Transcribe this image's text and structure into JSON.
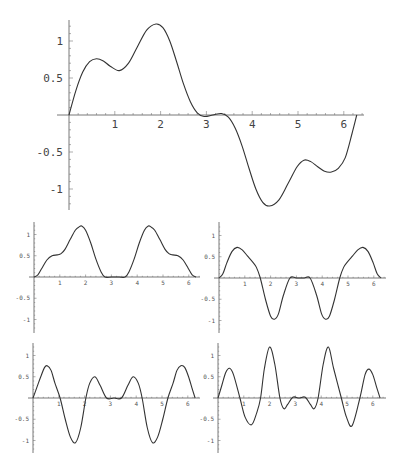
{
  "chart_data": [
    {
      "type": "line",
      "name": "main-plot",
      "title": "",
      "xlabel": "",
      "ylabel": "",
      "xlim": [
        0,
        6.283
      ],
      "ylim": [
        -1.3,
        1.3
      ],
      "grid": false,
      "x_ticks": [
        1,
        2,
        3,
        4,
        5,
        6
      ],
      "x_tick_labels": [
        "1",
        "2",
        "3",
        "4",
        "5",
        "6"
      ],
      "y_ticks": [
        -1,
        -0.5,
        0.5,
        1
      ],
      "y_tick_labels": [
        "-1",
        "-0.5",
        "0.5",
        "1"
      ],
      "frame": {
        "ox": 69,
        "oy": 115,
        "sx": 45.8,
        "sy": 74,
        "ytop": 20,
        "ybot": 210,
        "xend": 364,
        "label_size": "big"
      },
      "x": [
        0,
        0.15,
        0.3,
        0.45,
        0.6,
        0.75,
        0.9,
        1.1,
        1.3,
        1.5,
        1.7,
        1.9,
        2.05,
        2.2,
        2.35,
        2.5,
        2.65,
        2.8,
        2.95,
        3.14,
        3.33,
        3.48,
        3.63,
        3.78,
        3.93,
        4.08,
        4.23,
        4.38,
        4.58,
        4.78,
        4.98,
        5.13,
        5.28,
        5.43,
        5.58,
        5.73,
        5.88,
        6.03,
        6.18,
        6.283
      ],
      "values": [
        0,
        0.33,
        0.58,
        0.72,
        0.76,
        0.73,
        0.66,
        0.6,
        0.7,
        0.93,
        1.15,
        1.23,
        1.18,
        1.0,
        0.72,
        0.42,
        0.18,
        0.03,
        -0.02,
        0,
        0.02,
        -0.03,
        -0.18,
        -0.42,
        -0.72,
        -1.0,
        -1.18,
        -1.23,
        -1.15,
        -0.93,
        -0.7,
        -0.61,
        -0.63,
        -0.7,
        -0.76,
        -0.77,
        -0.72,
        -0.58,
        -0.25,
        0
      ]
    },
    {
      "type": "line",
      "name": "panel-top-left",
      "xlim": [
        0,
        6.283
      ],
      "ylim": [
        -1.3,
        1.3
      ],
      "x_ticks": [
        1,
        2,
        3,
        4,
        5,
        6
      ],
      "x_tick_labels": [
        "1",
        "2",
        "3",
        "4",
        "5",
        "6"
      ],
      "y_ticks": [
        -1,
        -0.5,
        0.5,
        1
      ],
      "y_tick_labels": [
        "-1",
        "-0.5",
        "0.5",
        "1"
      ],
      "frame": {
        "ox": 34,
        "oy": 277,
        "sx": 25.8,
        "sy": 42.5,
        "ytop": 222,
        "ybot": 333,
        "xend": 200,
        "label_size": "small"
      },
      "x": [
        0,
        0.15,
        0.3,
        0.5,
        0.7,
        0.9,
        1.05,
        1.2,
        1.4,
        1.6,
        1.75,
        1.85,
        2.0,
        2.2,
        2.4,
        2.6,
        2.75,
        3.0,
        3.3,
        3.53,
        3.68,
        3.88,
        4.08,
        4.28,
        4.43,
        4.53,
        4.68,
        4.88,
        5.08,
        5.23,
        5.38,
        5.58,
        5.78,
        5.98,
        6.13,
        6.283
      ],
      "values": [
        0,
        0.05,
        0.2,
        0.4,
        0.5,
        0.52,
        0.55,
        0.65,
        0.88,
        1.1,
        1.18,
        1.2,
        1.1,
        0.8,
        0.42,
        0.12,
        0,
        0,
        0,
        0,
        0.12,
        0.42,
        0.8,
        1.1,
        1.2,
        1.18,
        1.1,
        0.88,
        0.65,
        0.55,
        0.52,
        0.5,
        0.4,
        0.2,
        0.05,
        0
      ]
    },
    {
      "type": "line",
      "name": "panel-top-right",
      "xlim": [
        0,
        6.283
      ],
      "ylim": [
        -1.3,
        1.3
      ],
      "x_ticks": [
        1,
        2,
        3,
        4,
        5,
        6
      ],
      "x_tick_labels": [
        "1",
        "2",
        "3",
        "4",
        "5",
        "6"
      ],
      "y_ticks": [
        -1,
        -0.5,
        0.5,
        1
      ],
      "y_tick_labels": [
        "-1",
        "-0.5",
        "0.5",
        "1"
      ],
      "frame": {
        "ox": 219,
        "oy": 278,
        "sx": 25.8,
        "sy": 42.5,
        "ytop": 222,
        "ybot": 333,
        "xend": 386,
        "label_size": "small"
      },
      "x": [
        0,
        0.15,
        0.3,
        0.5,
        0.7,
        0.9,
        1.1,
        1.3,
        1.45,
        1.6,
        1.8,
        2.0,
        2.15,
        2.3,
        2.5,
        2.75,
        3.0,
        3.3,
        3.53,
        3.78,
        3.98,
        4.13,
        4.28,
        4.48,
        4.68,
        4.83,
        4.98,
        5.18,
        5.38,
        5.58,
        5.78,
        5.98,
        6.13,
        6.283
      ],
      "values": [
        0,
        0.1,
        0.35,
        0.62,
        0.72,
        0.66,
        0.52,
        0.38,
        0.25,
        0,
        -0.5,
        -0.9,
        -0.97,
        -0.85,
        -0.4,
        0,
        0,
        0,
        0,
        -0.4,
        -0.85,
        -0.97,
        -0.9,
        -0.5,
        0,
        0.25,
        0.38,
        0.52,
        0.66,
        0.72,
        0.62,
        0.35,
        0.1,
        0
      ]
    },
    {
      "type": "line",
      "name": "panel-bottom-left",
      "xlim": [
        0,
        6.283
      ],
      "ylim": [
        -1.3,
        1.3
      ],
      "x_ticks": [
        1,
        2,
        3,
        4,
        5,
        6
      ],
      "x_tick_labels": [
        "1",
        "2",
        "3",
        "4",
        "5",
        "6"
      ],
      "y_ticks": [
        -1,
        -0.5,
        0.5,
        1
      ],
      "y_tick_labels": [
        "-1",
        "-0.5",
        "0.5",
        "1"
      ],
      "frame": {
        "ox": 33,
        "oy": 398,
        "sx": 25.8,
        "sy": 42.5,
        "ytop": 343,
        "ybot": 453,
        "xend": 200,
        "label_size": "small"
      },
      "x": [
        0,
        0.15,
        0.3,
        0.45,
        0.55,
        0.7,
        0.85,
        1.05,
        1.25,
        1.45,
        1.65,
        1.85,
        2.05,
        2.2,
        2.4,
        2.6,
        2.85,
        3.14,
        3.43,
        3.68,
        3.88,
        4.08,
        4.23,
        4.43,
        4.63,
        4.83,
        5.03,
        5.23,
        5.43,
        5.58,
        5.73,
        5.88,
        6.03,
        6.18,
        6.283
      ],
      "values": [
        0,
        0.25,
        0.5,
        0.72,
        0.76,
        0.65,
        0.35,
        0,
        -0.5,
        -0.92,
        -1.05,
        -0.7,
        0,
        0.35,
        0.5,
        0.3,
        0,
        0,
        0,
        0.3,
        0.5,
        0.35,
        0,
        -0.7,
        -1.05,
        -0.92,
        -0.5,
        0,
        0.35,
        0.65,
        0.76,
        0.72,
        0.5,
        0.2,
        0
      ]
    },
    {
      "type": "line",
      "name": "panel-bottom-right",
      "xlim": [
        0,
        6.283
      ],
      "ylim": [
        -1.3,
        1.3
      ],
      "x_ticks": [
        1,
        2,
        3,
        4,
        5,
        6
      ],
      "x_tick_labels": [
        "1",
        "2",
        "3",
        "4",
        "5",
        "6"
      ],
      "y_ticks": [
        -1,
        -0.5,
        0.5,
        1
      ],
      "y_tick_labels": [
        "-1",
        "-0.5",
        "0.5",
        "1"
      ],
      "frame": {
        "ox": 218,
        "oy": 398,
        "sx": 25.8,
        "sy": 42.5,
        "ytop": 343,
        "ybot": 453,
        "xend": 386,
        "label_size": "small"
      },
      "x": [
        0,
        0.15,
        0.3,
        0.45,
        0.6,
        0.85,
        1.05,
        1.3,
        1.5,
        1.65,
        1.8,
        2.0,
        2.2,
        2.4,
        2.55,
        2.7,
        2.9,
        3.14,
        3.38,
        3.58,
        3.73,
        3.88,
        4.08,
        4.28,
        4.48,
        4.78,
        4.98,
        5.2,
        5.5,
        5.7,
        5.85,
        6.0,
        6.15,
        6.283
      ],
      "values": [
        0,
        0.3,
        0.6,
        0.7,
        0.55,
        0,
        -0.45,
        -0.63,
        -0.35,
        0,
        0.7,
        1.2,
        0.8,
        0,
        -0.25,
        -0.15,
        0.02,
        0,
        0.02,
        -0.15,
        -0.25,
        0,
        0.8,
        1.2,
        0.7,
        0,
        -0.45,
        -0.65,
        0,
        0.55,
        0.68,
        0.55,
        0.25,
        0
      ]
    }
  ]
}
